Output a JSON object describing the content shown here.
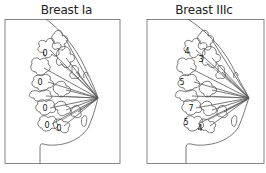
{
  "figure": {
    "panels": [
      {
        "title": "Breast Ia",
        "node_labels": [
          {
            "value": "0",
            "x": 45,
            "y": 56
          },
          {
            "value": "0",
            "x": 40,
            "y": 85
          },
          {
            "value": "0",
            "x": 45,
            "y": 111
          },
          {
            "value": "0",
            "x": 47,
            "y": 128
          },
          {
            "value": "0",
            "x": 59,
            "y": 131
          }
        ]
      },
      {
        "title": "Breast IIIc",
        "node_labels": [
          {
            "value": "4",
            "x": 54,
            "y": 54
          },
          {
            "value": "3",
            "x": 67,
            "y": 62
          },
          {
            "value": "5",
            "x": 49,
            "y": 85
          },
          {
            "value": "7",
            "x": 58,
            "y": 111
          },
          {
            "value": "5",
            "x": 53,
            "y": 125
          },
          {
            "value": "4",
            "x": 67,
            "y": 131
          }
        ]
      }
    ],
    "colors": {
      "line": "#555555",
      "frame": "#666666",
      "text": "#222222",
      "background": "#ffffff"
    }
  }
}
